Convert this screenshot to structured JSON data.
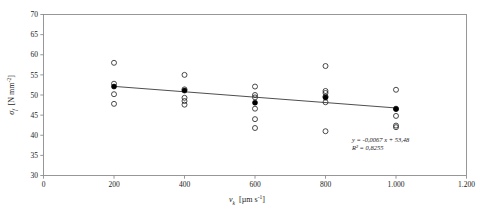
{
  "chart_data": {
    "type": "scatter",
    "title": "",
    "xlabel": "v_k  [µm s⁻¹]",
    "ylabel": "σ_f  [N mm⁻²]",
    "xlabel_symbol": "v",
    "xlabel_sub": "k",
    "xlabel_units": "[µm s",
    "xlabel_units_exp": "-1",
    "xlabel_units_close": "]",
    "ylabel_symbol": "σ",
    "ylabel_sub": "f",
    "ylabel_units": "[N mm",
    "ylabel_units_exp": "-2",
    "ylabel_units_close": "]",
    "xlim": [
      0,
      1200
    ],
    "ylim": [
      30,
      70
    ],
    "xticks": [
      0,
      200,
      400,
      600,
      800,
      1000,
      1200
    ],
    "xtick_labels": [
      "0",
      "200",
      "400",
      "600",
      "800",
      "1.000",
      "1.200"
    ],
    "yticks": [
      30,
      35,
      40,
      45,
      50,
      55,
      60,
      65,
      70
    ],
    "ytick_labels": [
      "30",
      "35",
      "40",
      "45",
      "50",
      "55",
      "60",
      "65",
      "70"
    ],
    "grid": false,
    "legend": null,
    "categories": [
      200,
      400,
      600,
      800,
      1000
    ],
    "series": [
      {
        "name": "individual measurements",
        "marker": "open-circle",
        "points": [
          {
            "x": 200,
            "y": 58.0
          },
          {
            "x": 200,
            "y": 52.8
          },
          {
            "x": 200,
            "y": 50.2
          },
          {
            "x": 200,
            "y": 47.8
          },
          {
            "x": 400,
            "y": 55.0
          },
          {
            "x": 400,
            "y": 51.4
          },
          {
            "x": 400,
            "y": 49.3
          },
          {
            "x": 400,
            "y": 48.5
          },
          {
            "x": 400,
            "y": 47.6
          },
          {
            "x": 600,
            "y": 52.1
          },
          {
            "x": 600,
            "y": 50.0
          },
          {
            "x": 600,
            "y": 49.4
          },
          {
            "x": 600,
            "y": 46.6
          },
          {
            "x": 600,
            "y": 44.0
          },
          {
            "x": 600,
            "y": 41.8
          },
          {
            "x": 800,
            "y": 57.2
          },
          {
            "x": 800,
            "y": 51.0
          },
          {
            "x": 800,
            "y": 50.5
          },
          {
            "x": 800,
            "y": 49.6
          },
          {
            "x": 800,
            "y": 48.2
          },
          {
            "x": 800,
            "y": 41.0
          },
          {
            "x": 1000,
            "y": 51.3
          },
          {
            "x": 1000,
            "y": 46.6
          },
          {
            "x": 1000,
            "y": 44.8
          },
          {
            "x": 1000,
            "y": 42.4
          },
          {
            "x": 1000,
            "y": 42.0
          }
        ]
      },
      {
        "name": "mean values",
        "marker": "filled-circle",
        "points": [
          {
            "x": 200,
            "y": 52.1
          },
          {
            "x": 400,
            "y": 51.1
          },
          {
            "x": 600,
            "y": 48.1
          },
          {
            "x": 800,
            "y": 49.4
          },
          {
            "x": 1000,
            "y": 46.5
          }
        ]
      }
    ],
    "trendline": {
      "slope": -0.0067,
      "intercept": 53.48,
      "r_squared": 0.8255,
      "x_start": 200,
      "x_end": 1000
    },
    "annotations": {
      "equation": "y = -0,0067 x + 53,48",
      "r2": "R² = 0,8255"
    }
  }
}
